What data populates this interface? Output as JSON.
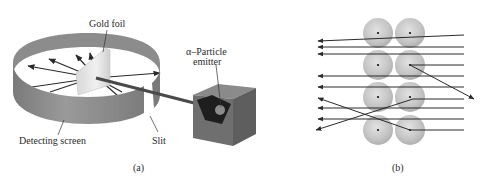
{
  "figure": {
    "panel_a": {
      "caption": "(a)",
      "labels": {
        "gold_foil": "Gold foil",
        "emitter_line1": "α–Particle",
        "emitter_line2": "emitter",
        "detecting_screen": "Detecting screen",
        "slit": "Slit"
      }
    },
    "panel_b": {
      "caption": "(b)",
      "atom_columns": 2,
      "atom_rows": 4
    },
    "colors": {
      "screen": "#8a8a8a",
      "screen_dark": "#6e6e6e",
      "foil": "#e6e6e6",
      "box": "#6a6a6a",
      "atom": "#c2c2c2",
      "arrow": "#333333"
    }
  }
}
